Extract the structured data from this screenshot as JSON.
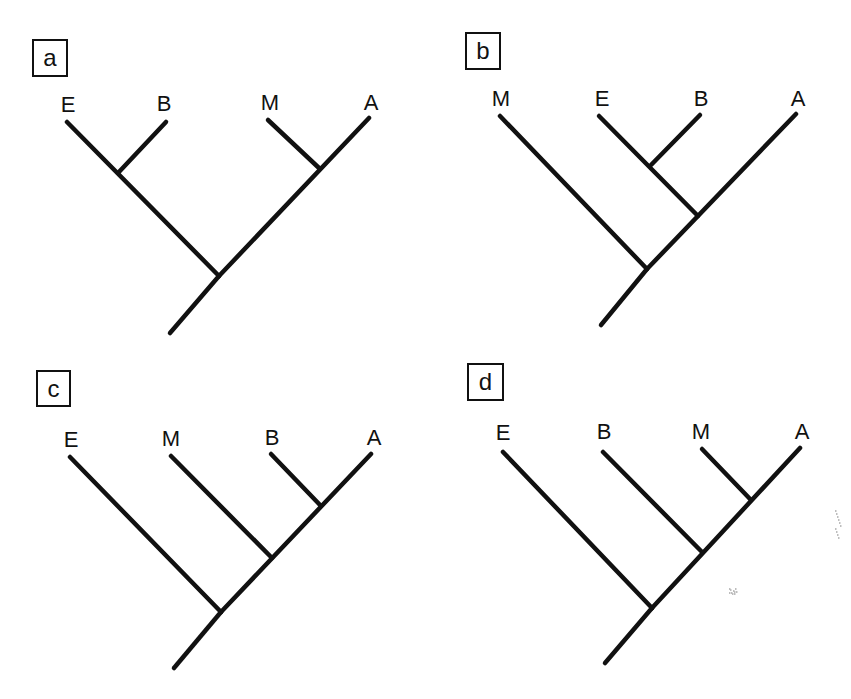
{
  "figure": {
    "background_color": "#ffffff",
    "line_color": "#111111"
  },
  "panels": [
    {
      "id": "a",
      "label": "a",
      "box": {
        "x": 33,
        "y": 40,
        "w": 34,
        "h": 36
      },
      "leaves": [
        {
          "name": "E",
          "label_x": 68,
          "label_y": 112,
          "tip": [
            67,
            122
          ]
        },
        {
          "name": "B",
          "label_x": 164,
          "label_y": 111,
          "tip": [
            166,
            122
          ]
        },
        {
          "name": "M",
          "label_x": 270,
          "label_y": 110,
          "tip": [
            268,
            120
          ]
        },
        {
          "name": "A",
          "label_x": 371,
          "label_y": 110,
          "tip": [
            369,
            118
          ]
        }
      ],
      "newick": "((E,B),(M,A))",
      "branches": [
        [
          170,
          333,
          219,
          276
        ],
        [
          219,
          276,
          369,
          118
        ],
        [
          219,
          276,
          67,
          122
        ],
        [
          118,
          173,
          166,
          122
        ],
        [
          319,
          168,
          268,
          120
        ]
      ]
    },
    {
      "id": "b",
      "label": "b",
      "box": {
        "x": 466,
        "y": 33,
        "w": 34,
        "h": 36
      },
      "leaves": [
        {
          "name": "M",
          "label_x": 501,
          "label_y": 106,
          "tip": [
            500,
            116
          ]
        },
        {
          "name": "E",
          "label_x": 602,
          "label_y": 106,
          "tip": [
            599,
            116
          ]
        },
        {
          "name": "B",
          "label_x": 701,
          "label_y": 106,
          "tip": [
            700,
            115
          ]
        },
        {
          "name": "A",
          "label_x": 798,
          "label_y": 106,
          "tip": [
            796,
            114
          ]
        }
      ],
      "newick": "(M,((E,B),A))",
      "branches": [
        [
          601,
          325,
          647,
          269
        ],
        [
          647,
          269,
          796,
          114
        ],
        [
          647,
          269,
          500,
          116
        ],
        [
          698,
          216,
          599,
          116
        ],
        [
          651,
          165,
          700,
          115
        ]
      ]
    },
    {
      "id": "c",
      "label": "c",
      "box": {
        "x": 37,
        "y": 371,
        "w": 33,
        "h": 35
      },
      "leaves": [
        {
          "name": "E",
          "label_x": 71,
          "label_y": 447,
          "tip": [
            70,
            457
          ]
        },
        {
          "name": "M",
          "label_x": 171,
          "label_y": 446,
          "tip": [
            171,
            456
          ]
        },
        {
          "name": "B",
          "label_x": 272,
          "label_y": 445,
          "tip": [
            271,
            454
          ]
        },
        {
          "name": "A",
          "label_x": 374,
          "label_y": 445,
          "tip": [
            371,
            454
          ]
        }
      ],
      "newick": "(E,(M,(B,A)))",
      "branches": [
        [
          174,
          668,
          221,
          612
        ],
        [
          221,
          612,
          371,
          454
        ],
        [
          221,
          612,
          70,
          457
        ],
        [
          272,
          558,
          171,
          456
        ],
        [
          321,
          506,
          271,
          454
        ]
      ]
    },
    {
      "id": "d",
      "label": "d",
      "box": {
        "x": 468,
        "y": 364,
        "w": 35,
        "h": 36
      },
      "leaves": [
        {
          "name": "E",
          "label_x": 503,
          "label_y": 440,
          "tip": [
            503,
            452
          ]
        },
        {
          "name": "B",
          "label_x": 604,
          "label_y": 439,
          "tip": [
            603,
            452
          ]
        },
        {
          "name": "M",
          "label_x": 701,
          "label_y": 439,
          "tip": [
            702,
            449
          ]
        },
        {
          "name": "A",
          "label_x": 802,
          "label_y": 439,
          "tip": [
            800,
            448
          ]
        }
      ],
      "newick": "(E,(B,(M,A)))",
      "branches": [
        [
          605,
          663,
          652,
          608
        ],
        [
          652,
          608,
          800,
          448
        ],
        [
          652,
          608,
          503,
          452
        ],
        [
          702,
          552,
          603,
          452
        ],
        [
          751,
          500,
          702,
          449
        ]
      ]
    }
  ],
  "specks": [
    {
      "x": 835,
      "y": 510,
      "w": 6,
      "h": 50
    },
    {
      "x": 729,
      "y": 588,
      "w": 8,
      "h": 6
    }
  ]
}
